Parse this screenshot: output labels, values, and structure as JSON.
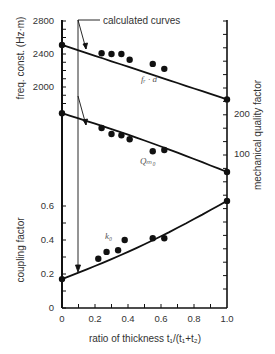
{
  "chart_data": {
    "type": "line",
    "title": "",
    "xlabel": "ratio of thickness t₁/(t₁+t₂)",
    "xlim": [
      0,
      1.0
    ],
    "xticks": [
      "0",
      "0.2",
      "0.4",
      "0.6",
      "0.8",
      "1.0"
    ],
    "annotation": "calculated curves",
    "axes": [
      {
        "id": "freq",
        "side": "left",
        "label": "freq. const. (Hz·m)",
        "ticks": [
          "2800",
          "2400",
          "2000"
        ],
        "range": [
          1800,
          2800
        ]
      },
      {
        "id": "coupling",
        "side": "left",
        "label": "coupling factor",
        "ticks": [
          "0.6",
          "0.4",
          "0.2",
          "0"
        ],
        "range": [
          0,
          0.6
        ]
      },
      {
        "id": "Q",
        "side": "right",
        "label": "mechanical quality factor",
        "ticks": [
          "200",
          "100"
        ],
        "range": [
          0,
          250
        ]
      }
    ],
    "series": [
      {
        "name": "fᵣ·d",
        "axis": "freq",
        "kind": "calculated",
        "x": [
          0,
          1.0
        ],
        "values": [
          2510,
          1850
        ]
      },
      {
        "name": "fᵣ·d measured",
        "axis": "freq",
        "kind": "measured",
        "x": [
          0,
          0.24,
          0.3,
          0.36,
          0.41,
          0.55,
          0.62,
          1.0
        ],
        "values": [
          2510,
          2410,
          2400,
          2400,
          2330,
          2280,
          2220,
          1850
        ]
      },
      {
        "name": "Qₘ₀",
        "axis": "Q",
        "kind": "calculated",
        "x": [
          0,
          1.0
        ],
        "values": [
          202,
          55
        ]
      },
      {
        "name": "Qₘ₀ measured",
        "axis": "Q",
        "kind": "measured",
        "x": [
          0,
          0.24,
          0.3,
          0.36,
          0.41,
          0.55,
          0.62,
          1.0
        ],
        "values": [
          202,
          165,
          150,
          147,
          137,
          107,
          110,
          55
        ]
      },
      {
        "name": "k₀",
        "axis": "coupling",
        "kind": "calculated",
        "x": [
          0,
          1.0
        ],
        "values": [
          0.17,
          0.63
        ]
      },
      {
        "name": "k₀ measured",
        "axis": "coupling",
        "kind": "measured",
        "x": [
          0,
          0.22,
          0.27,
          0.34,
          0.38,
          0.55,
          0.62,
          1.0
        ],
        "values": [
          0.17,
          0.29,
          0.33,
          0.34,
          0.4,
          0.41,
          0.41,
          0.63
        ]
      }
    ],
    "grid": false,
    "legend": "none"
  },
  "labels": {
    "annotation": "calculated curves",
    "curve_fd": "fᵣ · d",
    "curve_q": "Qₘ₀",
    "curve_k": "k₀",
    "x_axis": "ratio of thickness t₁/(t₁+t₂)",
    "y_left_top": "freq. const. (Hz·m)",
    "y_left_bottom": "coupling factor",
    "y_right": "mechanical quality factor",
    "x_ticks": [
      "0",
      "0.2",
      "0.4",
      "0.6",
      "0.8",
      "1.0"
    ],
    "freq_ticks": [
      "2800",
      "2400",
      "2000"
    ],
    "k_ticks": [
      "0.6",
      "0.4",
      "0.2",
      "0"
    ],
    "q_ticks": [
      "200",
      "100"
    ]
  }
}
